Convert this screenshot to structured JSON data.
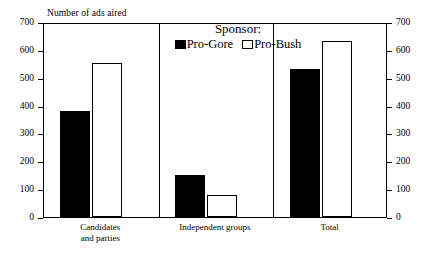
{
  "chart_data": {
    "type": "bar",
    "title": "",
    "ylabel": "Number of ads aired",
    "xlabel": "",
    "ylim": [
      0,
      700
    ],
    "yticks": [
      0,
      100,
      200,
      300,
      400,
      500,
      600,
      700
    ],
    "ytick_labels": [
      "0",
      "100",
      "200",
      "300",
      "400",
      "500",
      "600",
      "700"
    ],
    "right_axis": {
      "ylim": [
        0,
        700
      ],
      "yticks": [
        0,
        100,
        200,
        300,
        400,
        500,
        600,
        700
      ],
      "ytick_labels": [
        "0",
        "100",
        "200",
        "300",
        "400",
        "500",
        "600",
        "700"
      ]
    },
    "grid": false,
    "legend_position": "top-center",
    "legend_title": "Sponsor:",
    "categories": [
      "Candidates\nand parties",
      "Independent groups",
      "Total"
    ],
    "series": [
      {
        "name": "Pro-Gore",
        "color": "#000000",
        "fill": "solid",
        "values": [
          382,
          150,
          533
        ]
      },
      {
        "name": "Pro-Bush",
        "color": "#ffffff",
        "fill": "hollow",
        "values": [
          553,
          80,
          632
        ]
      }
    ]
  },
  "legend": {
    "title": "Sponsor:",
    "entries": [
      {
        "label": "Pro-Gore",
        "swatch": "filled-square-icon"
      },
      {
        "label": "Pro-Bush",
        "swatch": "hollow-square-icon"
      }
    ]
  },
  "axes": {
    "y_axis_title": "Number of ads aired",
    "left_ticks": [
      "700",
      "600",
      "500",
      "400",
      "300",
      "200",
      "100",
      "0"
    ],
    "right_ticks": [
      "700",
      "600",
      "500",
      "400",
      "300",
      "200",
      "100",
      "0"
    ]
  },
  "categories": [
    {
      "label": "Candidates\nand parties"
    },
    {
      "label": "Independent groups"
    },
    {
      "label": "Total"
    }
  ]
}
